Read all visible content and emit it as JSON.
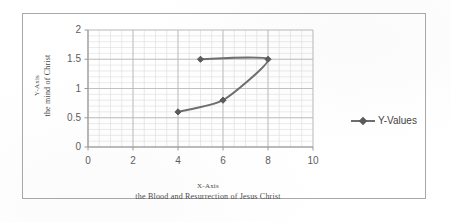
{
  "chart_data": {
    "type": "scatter",
    "title": "",
    "xlabel": "X-Axis the Blood and Resurrection of Jesus Christ",
    "ylabel": "Y-Axis the mind of Christ",
    "xlabel_line1": "X-Axis",
    "xlabel_line2": "the Blood and Resurrection of Jesus Christ",
    "ylabel_line1": "Y-Axis",
    "ylabel_line2": "the mind of Christ",
    "xlim": [
      0,
      10
    ],
    "ylim": [
      0,
      2
    ],
    "x_ticks": [
      "0",
      "2",
      "4",
      "6",
      "8",
      "10"
    ],
    "x_tick_values": [
      0,
      2,
      4,
      6,
      8,
      10
    ],
    "y_ticks": [
      "0",
      "0.5",
      "1",
      "1.5",
      "2"
    ],
    "y_tick_values": [
      0,
      0.5,
      1,
      1.5,
      2
    ],
    "x_minor_step": 0.5,
    "y_minor_step": 0.1,
    "grid": true,
    "grid_minor": true,
    "legend_position": "right",
    "smooth": true,
    "series": [
      {
        "name": "Y-Values",
        "color": "#6e6e6e",
        "marker": "diamond",
        "x": [
          4,
          6,
          8,
          5
        ],
        "y": [
          0.6,
          0.8,
          1.5,
          1.5
        ],
        "points": [
          {
            "x": 4,
            "y": 0.6
          },
          {
            "x": 6,
            "y": 0.8
          },
          {
            "x": 8,
            "y": 1.5
          },
          {
            "x": 5,
            "y": 1.5
          }
        ]
      }
    ]
  },
  "legend": {
    "entries": [
      {
        "label": "Y-Values"
      }
    ]
  },
  "colors": {
    "series_line": "#6e6e6e",
    "series_marker": "#5a5a5a",
    "axis": "#9a9a9a",
    "grid_major": "#b9b9b9",
    "grid_minor": "#dcdcdc",
    "frame": "#a8a8a8",
    "tick_text": "#5d5d5d",
    "title_text": "#4a4a4a"
  }
}
